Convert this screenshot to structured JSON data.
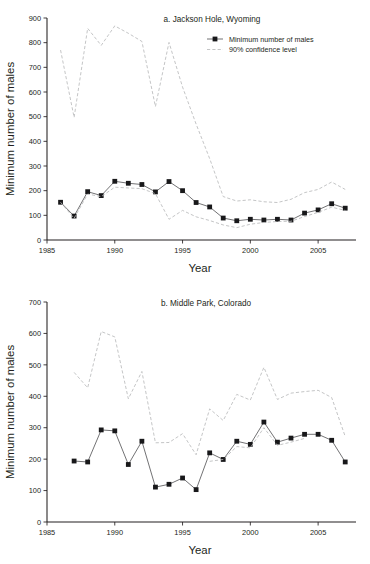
{
  "figure": {
    "axis_title_x": "Year",
    "axis_title_y": "Minimum number of males"
  },
  "legend": {
    "series_label": "Minimum number of males",
    "ci_label": "90% confidence level"
  },
  "colors": {
    "series": "#58595b",
    "marker": "#18181a",
    "confidence": "#b9babc",
    "axis": "#231f20",
    "text": "#231f20",
    "background": "#ffffff"
  },
  "chart_data": [
    {
      "id": "panel-a",
      "type": "line",
      "title": "a. Jackson Hole, Wyoming",
      "xlabel": "Year",
      "ylabel": "Minimum number of males",
      "xlim": [
        1985,
        2007.5
      ],
      "ylim": [
        0,
        900
      ],
      "xticks": [
        1985,
        1990,
        1995,
        2000,
        2005
      ],
      "xtick_labels": [
        "1985",
        "1990",
        "1995",
        "2000",
        "2005"
      ],
      "yticks": [
        0,
        100,
        200,
        300,
        400,
        500,
        600,
        700,
        800,
        900
      ],
      "ytick_labels": [
        "0",
        "100",
        "200",
        "300",
        "400",
        "500",
        "600",
        "700",
        "800",
        "900"
      ],
      "grid": false,
      "legend_position": "top-right",
      "series": [
        {
          "name": "Minimum number of males",
          "style": "solid-with-square-markers",
          "x": [
            1986,
            1987,
            1988,
            1989,
            1990,
            1991,
            1992,
            1993,
            1994,
            1995,
            1996,
            1997,
            1998,
            1999,
            2000,
            2001,
            2002,
            2003,
            2004,
            2005,
            2006,
            2007
          ],
          "values": [
            153,
            97,
            196,
            180,
            238,
            230,
            225,
            195,
            237,
            200,
            152,
            134,
            89,
            78,
            84,
            81,
            84,
            81,
            109,
            122,
            147,
            129
          ]
        },
        {
          "name": "90% confidence level upper",
          "style": "dashed",
          "x": [
            1986,
            1987,
            1988,
            1989,
            1990,
            1991,
            1992,
            1993,
            1994,
            1995,
            1996,
            1997,
            1998,
            1999,
            2000,
            2001,
            2002,
            2003,
            2004,
            2005,
            2006,
            2007
          ],
          "values": [
            770,
            497,
            858,
            789,
            868,
            838,
            805,
            541,
            801,
            620,
            470,
            330,
            176,
            158,
            163,
            155,
            152,
            165,
            192,
            205,
            235,
            205
          ]
        },
        {
          "name": "90% confidence level lower",
          "style": "dashed",
          "x": [
            1986,
            1987,
            1988,
            1989,
            1990,
            1991,
            1992,
            1993,
            1994,
            1995,
            1996,
            1997,
            1998,
            1999,
            2000,
            2001,
            2002,
            2003,
            2004,
            2005,
            2006,
            2007
          ],
          "values": [
            153,
            88,
            186,
            176,
            214,
            211,
            208,
            188,
            84,
            120,
            94,
            79,
            61,
            50,
            64,
            71,
            75,
            76,
            95,
            112,
            133,
            120
          ]
        }
      ]
    },
    {
      "id": "panel-b",
      "type": "line",
      "title": "b. Middle Park, Colorado",
      "xlabel": "Year",
      "ylabel": "Minimum number of males",
      "xlim": [
        1985,
        2007.5
      ],
      "ylim": [
        0,
        700
      ],
      "xticks": [
        1985,
        1990,
        1995,
        2000,
        2005
      ],
      "xtick_labels": [
        "1985",
        "1990",
        "1995",
        "2000",
        "2005"
      ],
      "yticks": [
        0,
        100,
        200,
        300,
        400,
        500,
        600,
        700
      ],
      "ytick_labels": [
        "0",
        "100",
        "200",
        "300",
        "400",
        "500",
        "600",
        "700"
      ],
      "grid": false,
      "legend_position": "none",
      "series": [
        {
          "name": "Minimum number of males",
          "style": "solid-with-square-markers",
          "x": [
            1987,
            1988,
            1989,
            1990,
            1991,
            1992,
            1993,
            1994,
            1995,
            1996,
            1997,
            1998,
            1999,
            2000,
            2001,
            2002,
            2003,
            2004,
            2005,
            2006,
            2007
          ],
          "values": [
            194,
            191,
            293,
            290,
            183,
            257,
            111,
            120,
            140,
            103,
            220,
            199,
            257,
            247,
            318,
            254,
            267,
            279,
            279,
            260,
            191
          ]
        },
        {
          "name": "90% confidence level upper",
          "style": "dashed",
          "x": [
            1987,
            1988,
            1989,
            1990,
            1991,
            1992,
            1993,
            1994,
            1995,
            1996,
            1997,
            1998,
            1999,
            2000,
            2001,
            2002,
            2003,
            2004,
            2005,
            2006,
            2007
          ],
          "values": [
            476,
            427,
            606,
            589,
            392,
            479,
            252,
            253,
            281,
            214,
            360,
            323,
            406,
            388,
            492,
            390,
            410,
            415,
            419,
            396,
            272
          ]
        },
        {
          "name": "90% confidence level lower",
          "style": "dashed",
          "x": [
            1997,
            1998,
            1999,
            2000,
            2001,
            2002,
            2003,
            2004
          ],
          "values": [
            193,
            199,
            240,
            236,
            300,
            244,
            254,
            266
          ]
        }
      ]
    }
  ]
}
